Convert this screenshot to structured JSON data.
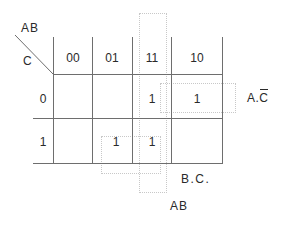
{
  "kmap": {
    "corner": {
      "col_var": "AB",
      "row_var": "C"
    },
    "columns": [
      "00",
      "01",
      "11",
      "10"
    ],
    "rows": [
      "0",
      "1"
    ],
    "cells": [
      [
        "",
        "",
        "1",
        "1"
      ],
      [
        "",
        "1",
        "1",
        ""
      ]
    ],
    "groups": [
      {
        "label_main": "A.",
        "label_overbar": "C",
        "cells": "row 0, columns 11 and 10"
      },
      {
        "label": "B.C.",
        "cells": "row 1, columns 01 and 11"
      },
      {
        "label": "AB",
        "cells": "column 11, rows 0 and 1"
      }
    ]
  },
  "colors": {
    "grid": "#6e6e6e",
    "text": "#2a2a2a",
    "group_outline": "#c8c8c8"
  }
}
